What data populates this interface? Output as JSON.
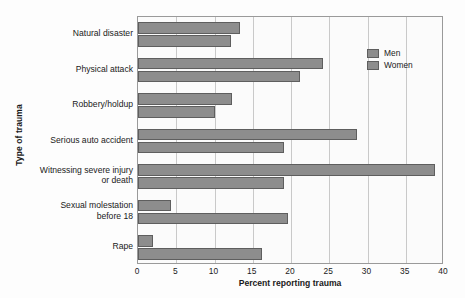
{
  "chart_data": {
    "type": "bar",
    "orientation": "horizontal",
    "title": "",
    "xlabel": "Percent reporting trauma",
    "ylabel": "Type of trauma",
    "xlim": [
      0,
      40
    ],
    "xticks": [
      0,
      5,
      10,
      15,
      20,
      25,
      30,
      35,
      40
    ],
    "grid": true,
    "legend_position": "top-right",
    "categories": [
      "Natural disaster",
      "Physical attack",
      "Robbery/holdup",
      "Serious auto accident",
      "Witnessing severe injury\nor death",
      "Sexual molestation\nbefore 18",
      "Rape"
    ],
    "series": [
      {
        "name": "Men",
        "color": "#8d8d8d",
        "values": [
          13.3,
          24.2,
          12.3,
          28.6,
          38.8,
          4.3,
          1.9
        ]
      },
      {
        "name": "Women",
        "color": "#8d8d8d",
        "values": [
          12.2,
          21.2,
          10.0,
          19.1,
          19.1,
          19.6,
          16.2
        ]
      }
    ]
  },
  "legend": {
    "items": [
      {
        "label": "Men"
      },
      {
        "label": "Women"
      }
    ]
  },
  "colors": {
    "bar_fill": "#8d8d8d",
    "bar_edge": "#5e5e5e",
    "grid": "#c9c9c9",
    "axis": "#9a9a9a",
    "background": "#fdfdfd"
  }
}
